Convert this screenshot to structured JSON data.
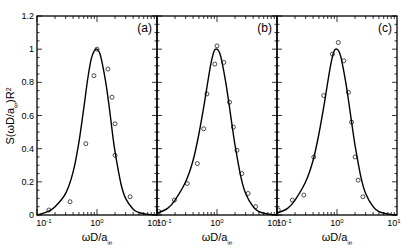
{
  "chart_data": {
    "type": "line",
    "layout": "three side-by-side panels sharing y-axis",
    "ylabel": "S(ωD/a∞)R²",
    "xlabel": "ωD/a∞",
    "xscale": "log",
    "xlim": [
      0.1,
      10
    ],
    "ylim": [
      0,
      1.2
    ],
    "yticks": [
      "0",
      "0.2",
      "0.4",
      "0.6",
      "0.8",
      "1",
      "1.2"
    ],
    "xticks": [
      "10⁻¹",
      "10⁰",
      "10¹"
    ],
    "grid": false,
    "legend": null,
    "panels": [
      {
        "label": "(a)",
        "series": [
          {
            "name": "model",
            "style": "solid line",
            "x": [
              0.1,
              0.15,
              0.2,
              0.3,
              0.4,
              0.5,
              0.6,
              0.7,
              0.8,
              0.9,
              1.0,
              1.1,
              1.2,
              1.4,
              1.6,
              1.8,
              2.0,
              2.5,
              3.0,
              4.0,
              5.0,
              7.0,
              10.0
            ],
            "y": [
              0.0,
              0.02,
              0.05,
              0.13,
              0.26,
              0.44,
              0.64,
              0.82,
              0.94,
              0.99,
              1.0,
              0.98,
              0.93,
              0.8,
              0.65,
              0.5,
              0.38,
              0.19,
              0.1,
              0.035,
              0.015,
              0.004,
              0.0
            ]
          },
          {
            "name": "measured",
            "style": "open circles",
            "x": [
              0.158,
              0.355,
              0.65,
              0.89,
              1.0,
              1.52,
              1.78,
              2.0,
              2.0,
              3.56
            ],
            "y": [
              0.03,
              0.08,
              0.43,
              0.84,
              1.0,
              0.88,
              0.71,
              0.55,
              0.36,
              0.11
            ]
          }
        ]
      },
      {
        "label": "(b)",
        "series": [
          {
            "name": "model",
            "style": "solid line",
            "x": [
              0.1,
              0.15,
              0.2,
              0.3,
              0.4,
              0.5,
              0.6,
              0.7,
              0.8,
              0.9,
              1.0,
              1.1,
              1.2,
              1.4,
              1.6,
              1.8,
              2.0,
              2.5,
              3.0,
              4.0,
              5.0,
              7.0,
              10.0
            ],
            "y": [
              0.01,
              0.04,
              0.09,
              0.2,
              0.33,
              0.49,
              0.65,
              0.8,
              0.92,
              0.99,
              1.0,
              0.98,
              0.93,
              0.8,
              0.66,
              0.53,
              0.42,
              0.23,
              0.13,
              0.05,
              0.02,
              0.006,
              0.0
            ]
          },
          {
            "name": "measured",
            "style": "open circles",
            "x": [
              0.108,
              0.195,
              0.32,
              0.47,
              0.6,
              0.68,
              0.92,
              1.0,
              1.3,
              1.62,
              1.88,
              2.15,
              2.6,
              3.3,
              4.4
            ],
            "y": [
              0.02,
              0.09,
              0.19,
              0.31,
              0.52,
              0.73,
              0.91,
              1.02,
              0.92,
              0.68,
              0.53,
              0.39,
              0.25,
              0.13,
              0.05
            ]
          }
        ]
      },
      {
        "label": "(c)",
        "series": [
          {
            "name": "model",
            "style": "solid line",
            "x": [
              0.1,
              0.15,
              0.2,
              0.3,
              0.4,
              0.5,
              0.6,
              0.7,
              0.8,
              0.9,
              1.0,
              1.1,
              1.2,
              1.4,
              1.6,
              1.8,
              2.0,
              2.5,
              3.0,
              4.0,
              5.0,
              7.0,
              10.0
            ],
            "y": [
              0.01,
              0.04,
              0.09,
              0.2,
              0.33,
              0.49,
              0.65,
              0.8,
              0.92,
              0.99,
              1.0,
              0.98,
              0.93,
              0.8,
              0.66,
              0.53,
              0.42,
              0.23,
              0.13,
              0.05,
              0.02,
              0.006,
              0.0
            ]
          },
          {
            "name": "measured",
            "style": "open circles",
            "x": [
              0.105,
              0.18,
              0.28,
              0.41,
              0.6,
              0.84,
              1.05,
              1.3,
              1.55,
              1.75,
              2.0,
              2.25,
              2.7
            ],
            "y": [
              0.03,
              0.09,
              0.12,
              0.35,
              0.72,
              0.97,
              1.04,
              0.93,
              0.74,
              0.56,
              0.35,
              0.21,
              0.11
            ]
          }
        ]
      }
    ]
  },
  "labels": {
    "ylabel_main": "S(ωD/a",
    "ylabel_sub": "∞",
    "ylabel_tail": ")R",
    "ylabel_sup": "2",
    "xlabel_main": "ωD/a",
    "xlabel_sub": "∞",
    "xtick_base": "10",
    "xtick_exps": [
      "-1",
      "0",
      "1"
    ]
  }
}
